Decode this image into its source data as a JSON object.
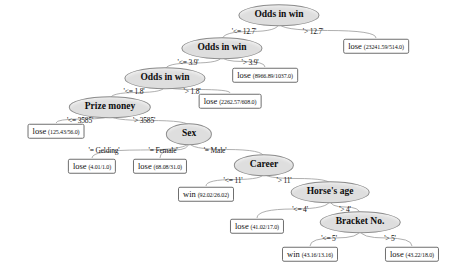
{
  "diagram": {
    "type": "decision-tree",
    "colors": {
      "decision_fill": "#dedede",
      "decision_stroke": "#8d8d8d",
      "leaf_fill": "#ffffff",
      "leaf_stroke": "#6f6f6f",
      "edge_stroke": "#9a9a9a",
      "background": "#ffffff"
    },
    "nodes": [
      {
        "id": "n0",
        "kind": "decision",
        "label": "Odds in win",
        "x": 279,
        "y": 15
      },
      {
        "id": "n1",
        "kind": "decision",
        "label": "Odds in win",
        "x": 222,
        "y": 48
      },
      {
        "id": "n2",
        "kind": "leaf",
        "label": "lose",
        "stats": "(23241.59/514.0)",
        "x": 376,
        "y": 46
      },
      {
        "id": "n3",
        "kind": "decision",
        "label": "Odds in win",
        "x": 165,
        "y": 78
      },
      {
        "id": "n4",
        "kind": "leaf",
        "label": "lose",
        "stats": "(8966.89/1037.0)",
        "x": 265,
        "y": 75
      },
      {
        "id": "n5",
        "kind": "decision",
        "label": "Prize money",
        "x": 110,
        "y": 107
      },
      {
        "id": "n6",
        "kind": "leaf",
        "label": "lose",
        "stats": "(2262.57/608.0)",
        "x": 230,
        "y": 101
      },
      {
        "id": "n7",
        "kind": "leaf",
        "label": "lose",
        "stats": "(125.43/56.0)",
        "x": 56,
        "y": 131
      },
      {
        "id": "n8",
        "kind": "decision",
        "label": "Sex",
        "x": 189,
        "y": 134
      },
      {
        "id": "n9",
        "kind": "leaf",
        "label": "lose",
        "stats": "(4.01/1.0)",
        "x": 92,
        "y": 166
      },
      {
        "id": "n10",
        "kind": "leaf",
        "label": "lose",
        "stats": "(68.08/31.0)",
        "x": 160,
        "y": 166
      },
      {
        "id": "n11",
        "kind": "decision",
        "label": "Career",
        "x": 264,
        "y": 165
      },
      {
        "id": "n12",
        "kind": "leaf",
        "label": "win",
        "stats": "(92.02/26.02)",
        "x": 206,
        "y": 194
      },
      {
        "id": "n13",
        "kind": "decision",
        "label": "Horse's age",
        "x": 330,
        "y": 192
      },
      {
        "id": "n14",
        "kind": "leaf",
        "label": "lose",
        "stats": "(41.02/17.0)",
        "x": 257,
        "y": 226
      },
      {
        "id": "n15",
        "kind": "decision",
        "label": "Bracket No.",
        "x": 360,
        "y": 222
      },
      {
        "id": "n16",
        "kind": "leaf",
        "label": "win",
        "stats": "(43.16/13.16)",
        "x": 310,
        "y": 254
      },
      {
        "id": "n17",
        "kind": "leaf",
        "label": "lose",
        "stats": "(43.22/18.0)",
        "x": 412,
        "y": 254
      }
    ],
    "edges": [
      {
        "from": "n0",
        "to": "n1",
        "label": "'<= 12.7'",
        "lx": 244,
        "ly": 31
      },
      {
        "from": "n0",
        "to": "n2",
        "label": "'> 12.7'",
        "lx": 313,
        "ly": 31
      },
      {
        "from": "n1",
        "to": "n3",
        "label": "'<= 3.9'",
        "lx": 188,
        "ly": 62
      },
      {
        "from": "n1",
        "to": "n4",
        "label": "'> 3.9'",
        "lx": 250,
        "ly": 62
      },
      {
        "from": "n3",
        "to": "n5",
        "label": "'<= 1.8'",
        "lx": 134,
        "ly": 91
      },
      {
        "from": "n3",
        "to": "n6",
        "label": "'> 1.8'",
        "lx": 192,
        "ly": 91
      },
      {
        "from": "n5",
        "to": "n7",
        "label": "'<= 3585'",
        "lx": 80,
        "ly": 120
      },
      {
        "from": "n5",
        "to": "n8",
        "label": "'> 3585'",
        "lx": 144,
        "ly": 120
      },
      {
        "from": "n8",
        "to": "n9",
        "label": "'= Gelding'",
        "lx": 104,
        "ly": 150
      },
      {
        "from": "n8",
        "to": "n10",
        "label": "'= Female'",
        "lx": 163,
        "ly": 150
      },
      {
        "from": "n8",
        "to": "n11",
        "label": "'= Male'",
        "lx": 215,
        "ly": 150
      },
      {
        "from": "n11",
        "to": "n12",
        "label": "'<= 11'",
        "lx": 233,
        "ly": 180
      },
      {
        "from": "n11",
        "to": "n13",
        "label": "'> 11'",
        "lx": 284,
        "ly": 180
      },
      {
        "from": "n13",
        "to": "n14",
        "label": "'<= 4'",
        "lx": 300,
        "ly": 209
      },
      {
        "from": "n13",
        "to": "n15",
        "label": "'> 4'",
        "lx": 345,
        "ly": 209
      },
      {
        "from": "n15",
        "to": "n16",
        "label": "'<= 5'",
        "lx": 329,
        "ly": 238
      },
      {
        "from": "n15",
        "to": "n17",
        "label": "'> 5'",
        "lx": 390,
        "ly": 238
      }
    ]
  }
}
